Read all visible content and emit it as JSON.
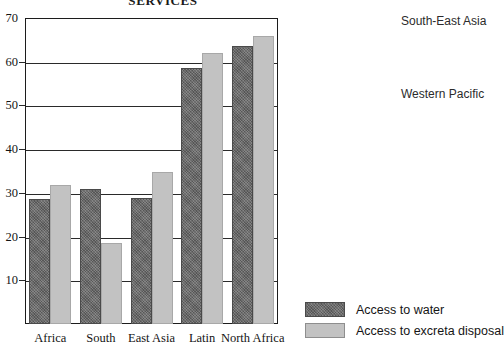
{
  "chart_data": {
    "type": "bar",
    "title": "SERVICES",
    "xlabel": "",
    "ylabel": "",
    "ylim": [
      0,
      70
    ],
    "yticks": [
      10,
      20,
      30,
      40,
      50,
      60,
      70
    ],
    "grid": true,
    "legend_position": "bottom-right",
    "categories": [
      "Africa",
      "South",
      "East Asia",
      "Latin",
      "North Africa"
    ],
    "series": [
      {
        "name": "Access to water",
        "color": "#6d6d6d",
        "values": [
          28.5,
          31.0,
          28.8,
          58.5,
          63.5
        ]
      },
      {
        "name": "Access to excreta disposal",
        "color": "#c2c2c2",
        "values": [
          31.8,
          18.5,
          34.8,
          62.0,
          65.8
        ]
      }
    ],
    "annotations": [
      "South-East Asia",
      "Western Pacific"
    ]
  },
  "title": "SERVICES",
  "axis": {
    "y_ticks": [
      "70",
      "60",
      "50",
      "40",
      "30",
      "20",
      "10"
    ],
    "x_labels": [
      "Africa",
      "South",
      "East Asia",
      "Latin",
      "North Africa"
    ]
  },
  "legend": {
    "items": [
      {
        "label": "Access to water",
        "swatch": "dark-hatched-swatch"
      },
      {
        "label": "Access to excreta disposal",
        "swatch": "light-gray-swatch"
      }
    ]
  },
  "region_notes": [
    "South-East Asia",
    "Western Pacific"
  ]
}
